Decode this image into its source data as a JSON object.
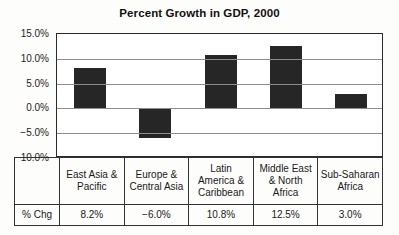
{
  "chart_data": {
    "type": "bar",
    "title": "Percent Growth in GDP, 2000",
    "xlabel": "",
    "ylabel": "",
    "categories": [
      "East Asia & Pacific",
      "Europe & Central Asia",
      "Latin America & Caribbean",
      "Middle East & North Africa",
      "Sub-Saharan Africa"
    ],
    "category_lines": [
      [
        "East Asia &",
        "Pacific"
      ],
      [
        "Europe &",
        "Central Asia"
      ],
      [
        "Latin",
        "America &",
        "Caribbean"
      ],
      [
        "Middle East",
        "& North",
        "Africa"
      ],
      [
        "Sub-Saharan",
        "Africa"
      ]
    ],
    "values": [
      8.2,
      -6.0,
      10.8,
      12.5,
      3.0
    ],
    "value_labels": [
      "8.2%",
      "−6.0%",
      "10.8%",
      "12.5%",
      "3.0%"
    ],
    "ylim": [
      -10.0,
      15.0
    ],
    "yticks": [
      15.0,
      10.0,
      5.0,
      0.0,
      -5.0,
      -10.0
    ],
    "ytick_labels": [
      "15.0%",
      "10.0%",
      "5.0%",
      "0.0%",
      "−5.0%",
      "−10.0%"
    ],
    "grid": true,
    "legend": null,
    "bar_color": "#262626",
    "units": "percent"
  },
  "table": {
    "row_label": "% Chg",
    "column_headers": [
      "East Asia & Pacific",
      "Europe & Central Asia",
      "Latin America & Caribbean",
      "Middle East & North Africa",
      "Sub-Saharan Africa"
    ],
    "values": [
      "8.2%",
      "−6.0%",
      "10.8%",
      "12.5%",
      "3.0%"
    ]
  }
}
